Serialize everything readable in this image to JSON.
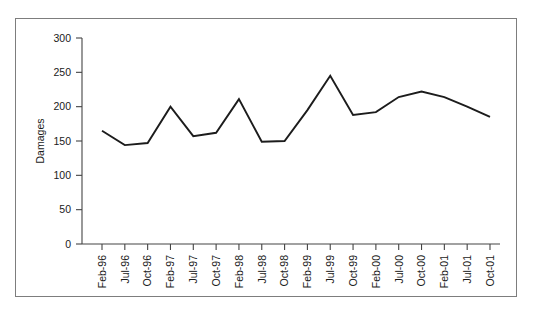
{
  "figure": {
    "background_color": "#ffffff",
    "frame_color": "#7d7d7d",
    "line_color": "#1c1c1c",
    "axis_color": "#444444"
  },
  "chart_data": {
    "type": "line",
    "title": "",
    "xlabel": "",
    "ylabel": "Damages",
    "ylim": [
      0,
      300
    ],
    "yticks": [
      0,
      50,
      100,
      150,
      200,
      250,
      300
    ],
    "ytick_labels": [
      "0",
      "50",
      "100",
      "150",
      "200",
      "250",
      "300"
    ],
    "grid": false,
    "legend": null,
    "categories": [
      "Feb-96",
      "Jul-96",
      "Oct-96",
      "Feb-97",
      "Jul-97",
      "Oct-97",
      "Feb-98",
      "Jul-98",
      "Oct-98",
      "Feb-99",
      "Jul-99",
      "Oct-99",
      "Feb-00",
      "Jul-00",
      "Oct-00",
      "Feb-01",
      "Jul-01",
      "Oct-01"
    ],
    "values": [
      165,
      144,
      147,
      200,
      157,
      162,
      211,
      149,
      150,
      195,
      245,
      188,
      192,
      214,
      222,
      214,
      200,
      185
    ],
    "series": [
      {
        "name": "Damages",
        "values": [
          165,
          144,
          147,
          200,
          157,
          162,
          211,
          149,
          150,
          195,
          245,
          188,
          192,
          214,
          222,
          214,
          200,
          185
        ]
      }
    ]
  }
}
